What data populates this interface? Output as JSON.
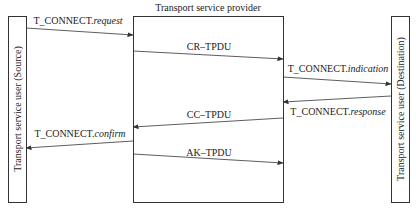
{
  "diagram": {
    "title": "Transport service provider",
    "entities": {
      "source": {
        "label": "Transport service user (Source)"
      },
      "provider": {
        "label": "Transport service provider"
      },
      "destination": {
        "label": "Transport service user (Destination)"
      }
    },
    "messages": [
      {
        "id": "m1",
        "prefix": "T_CONNECT.",
        "suffix": "request",
        "from": "source",
        "to": "provider"
      },
      {
        "id": "m2",
        "prefix": "CR–TPDU",
        "suffix": "",
        "from": "provider-left",
        "to": "provider-right"
      },
      {
        "id": "m3",
        "prefix": "T_CONNECT.",
        "suffix": "indication",
        "from": "provider",
        "to": "destination"
      },
      {
        "id": "m4",
        "prefix": "T_CONNECT.",
        "suffix": "response",
        "from": "destination",
        "to": "provider"
      },
      {
        "id": "m5",
        "prefix": "CC–TPDU",
        "suffix": "",
        "from": "provider-right",
        "to": "provider-left"
      },
      {
        "id": "m6",
        "prefix": "T_CONNECT.",
        "suffix": "confirm",
        "from": "provider",
        "to": "source"
      },
      {
        "id": "m7",
        "prefix": "AK–TPDU",
        "suffix": "",
        "from": "provider-left",
        "to": "provider-right"
      }
    ],
    "colors": {
      "line": "#333333",
      "background": "#ffffff"
    }
  }
}
